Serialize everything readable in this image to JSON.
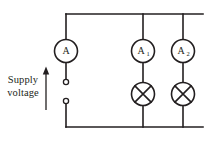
{
  "diagram": {
    "supply": {
      "label_line1": "Supply",
      "label_line2": "voltage",
      "arrow_direction": "up"
    },
    "meters": [
      {
        "id": "main",
        "label": "A",
        "subscript": ""
      },
      {
        "id": "branch1",
        "label": "A",
        "subscript": "1"
      },
      {
        "id": "branch2",
        "label": "A",
        "subscript": "2"
      }
    ],
    "lamps": [
      {
        "id": "lamp1",
        "symbol": "crossed-circle"
      },
      {
        "id": "lamp2",
        "symbol": "crossed-circle"
      }
    ],
    "terminals": [
      {
        "id": "terminal-top",
        "state": "open"
      },
      {
        "id": "terminal-bottom",
        "state": "open"
      }
    ],
    "colors": {
      "line": "#231f20",
      "background": "#ffffff"
    }
  }
}
